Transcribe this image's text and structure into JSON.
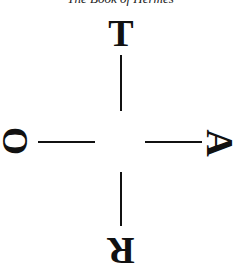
{
  "header": {
    "running_title": "The Book of Hermes"
  },
  "diagram": {
    "type": "cross of letters",
    "letters": {
      "top": "T",
      "right": "A",
      "bottom": "R",
      "left": "O"
    },
    "orientation": {
      "top": "upright",
      "right": "rotated 90° clockwise",
      "bottom": "rotated 180°",
      "left": "rotated 90°"
    }
  }
}
